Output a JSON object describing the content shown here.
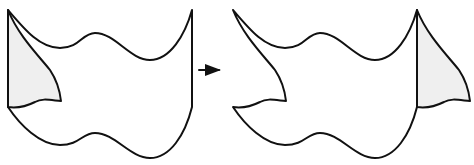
{
  "diagram": {
    "colors": {
      "stroke": "#111111",
      "piece_fill": "#efefef",
      "background": "#ffffff"
    },
    "panels": [
      {
        "id": "before",
        "label": ""
      },
      {
        "id": "after",
        "label": ""
      }
    ],
    "arrow": {
      "direction": "right",
      "from": [
        199,
        70
      ],
      "to": [
        221,
        70
      ]
    }
  }
}
